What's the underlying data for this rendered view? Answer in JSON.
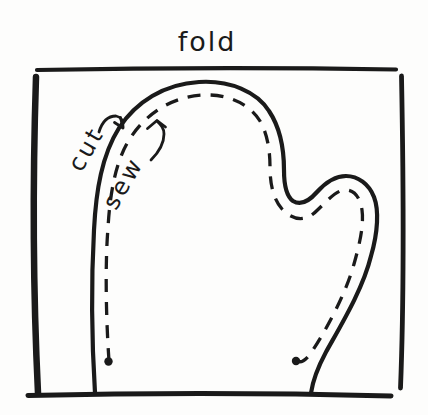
{
  "labels": {
    "fold": "fold",
    "cut": "cut",
    "sew": "sew"
  },
  "colors": {
    "ink": "#1a1a1a",
    "paper": "#fdfdfc"
  }
}
